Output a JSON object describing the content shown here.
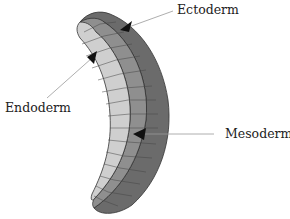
{
  "diagram": {
    "labels": {
      "ectoderm": "Ectoderm",
      "endoderm": "Endoderm",
      "mesoderm": "Mesoderm"
    },
    "layers": [
      {
        "name": "Ectoderm",
        "position": "outer",
        "color": "#6b6b6b"
      },
      {
        "name": "Mesoderm",
        "position": "middle",
        "color": "#8f8f8f"
      },
      {
        "name": "Endoderm",
        "position": "inner",
        "color": "#cfcfcf"
      }
    ],
    "colors": {
      "outline": "#333333",
      "leader_line": "#999999",
      "arrowhead": "#111111",
      "background": "#ffffff"
    }
  }
}
